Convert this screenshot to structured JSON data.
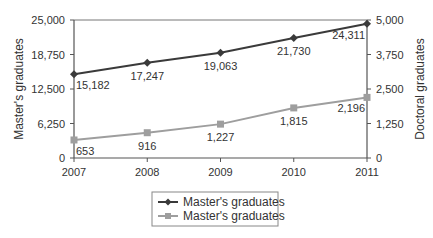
{
  "chart_data": {
    "type": "line",
    "title": "",
    "xlabel": "",
    "ylabel": "Master's graduates",
    "y2label": "Doctoral graduates",
    "categories": [
      "2007",
      "2008",
      "2009",
      "2010",
      "2011"
    ],
    "ylim": [
      0,
      25000
    ],
    "y2lim": [
      0,
      5000
    ],
    "yticks": [
      "0",
      "6,250",
      "12,500",
      "18,750",
      "25,000"
    ],
    "y2ticks": [
      "0",
      "1,250",
      "2,500",
      "3,750",
      "5,000"
    ],
    "grid": false,
    "legend_position": "bottom",
    "series": [
      {
        "name": "Master's graduates",
        "axis": "left",
        "values": [
          15182,
          17247,
          19063,
          21730,
          24311
        ],
        "labels": [
          "15,182",
          "17,247",
          "19,063",
          "21,730",
          "24,311"
        ],
        "color": "#3a3a3a",
        "marker": "diamond"
      },
      {
        "name": "Master's graduates",
        "axis": "right",
        "values": [
          653,
          916,
          1227,
          1815,
          2196
        ],
        "labels": [
          "653",
          "916",
          "1,227",
          "1,815",
          "2,196"
        ],
        "color": "#9e9e9e",
        "marker": "square"
      }
    ]
  }
}
